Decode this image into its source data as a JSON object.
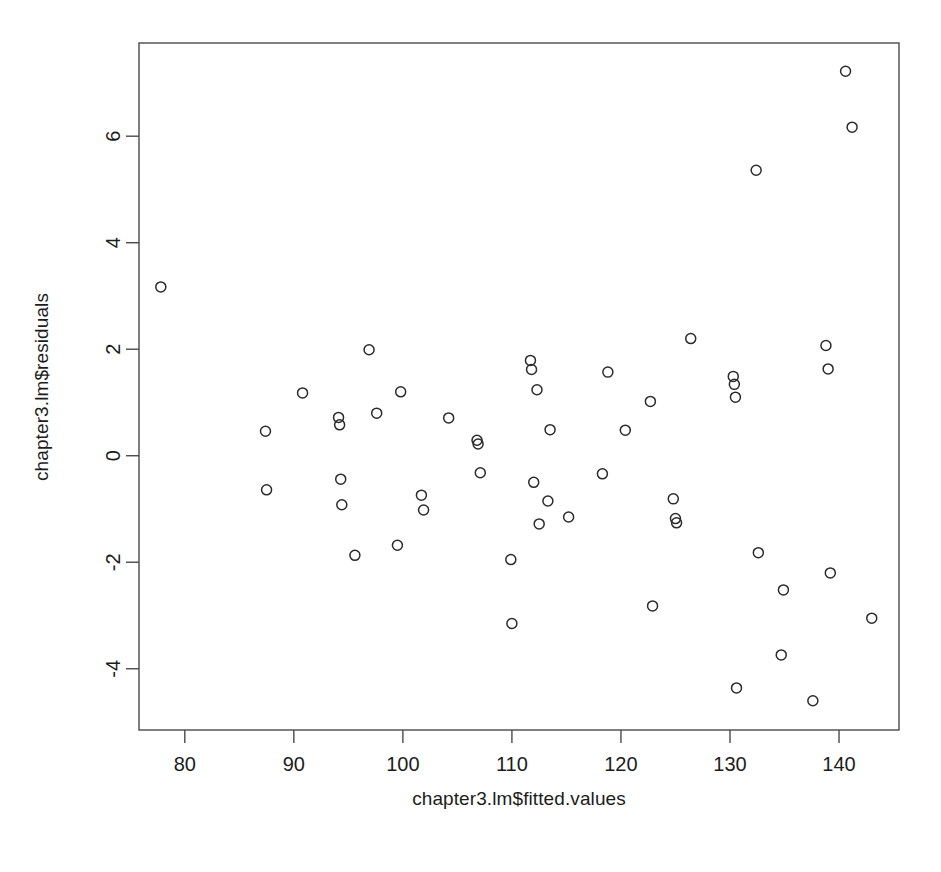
{
  "chart_data": {
    "type": "scatter",
    "title": "",
    "xlabel": "chapter3.lm$fitted.values",
    "ylabel": "chapter3.lm$residuals",
    "xlim": [
      75.8,
      145.5
    ],
    "ylim": [
      -5.15,
      7.75
    ],
    "xticks": [
      80,
      90,
      100,
      110,
      120,
      130,
      140
    ],
    "yticks": [
      -4,
      -2,
      0,
      2,
      4,
      6
    ],
    "xtick_labels": [
      "80",
      "90",
      "100",
      "110",
      "120",
      "130",
      "140"
    ],
    "ytick_labels": [
      "-4",
      "-2",
      "0",
      "2",
      "4",
      "6"
    ],
    "grid": false,
    "legend": false,
    "marker": "open-circle",
    "marker_color": "#2b2b2b",
    "point_count": 60,
    "points": [
      {
        "x": 77.8,
        "y": 3.17
      },
      {
        "x": 87.4,
        "y": 0.46
      },
      {
        "x": 87.5,
        "y": -0.64
      },
      {
        "x": 90.8,
        "y": 1.18
      },
      {
        "x": 94.1,
        "y": 0.72
      },
      {
        "x": 94.2,
        "y": 0.58
      },
      {
        "x": 94.3,
        "y": -0.44
      },
      {
        "x": 94.4,
        "y": -0.92
      },
      {
        "x": 95.6,
        "y": -1.87
      },
      {
        "x": 96.9,
        "y": 1.99
      },
      {
        "x": 97.6,
        "y": 0.8
      },
      {
        "x": 99.5,
        "y": -1.68
      },
      {
        "x": 99.8,
        "y": 1.2
      },
      {
        "x": 101.7,
        "y": -0.74
      },
      {
        "x": 101.9,
        "y": -1.02
      },
      {
        "x": 104.2,
        "y": 0.71
      },
      {
        "x": 106.8,
        "y": 0.29
      },
      {
        "x": 106.9,
        "y": 0.22
      },
      {
        "x": 107.1,
        "y": -0.32
      },
      {
        "x": 109.9,
        "y": -1.95
      },
      {
        "x": 110.0,
        "y": -3.15
      },
      {
        "x": 111.7,
        "y": 1.79
      },
      {
        "x": 111.8,
        "y": 1.62
      },
      {
        "x": 112.0,
        "y": -0.5
      },
      {
        "x": 112.3,
        "y": 1.24
      },
      {
        "x": 112.5,
        "y": -1.28
      },
      {
        "x": 113.3,
        "y": -0.85
      },
      {
        "x": 113.5,
        "y": 0.49
      },
      {
        "x": 115.2,
        "y": -1.15
      },
      {
        "x": 118.3,
        "y": -0.34
      },
      {
        "x": 118.8,
        "y": 1.57
      },
      {
        "x": 120.4,
        "y": 0.48
      },
      {
        "x": 122.7,
        "y": 1.02
      },
      {
        "x": 122.9,
        "y": -2.82
      },
      {
        "x": 124.8,
        "y": -0.81
      },
      {
        "x": 125.0,
        "y": -1.18
      },
      {
        "x": 125.1,
        "y": -1.26
      },
      {
        "x": 126.4,
        "y": 2.2
      },
      {
        "x": 130.3,
        "y": 1.49
      },
      {
        "x": 130.4,
        "y": 1.34
      },
      {
        "x": 130.5,
        "y": 1.1
      },
      {
        "x": 130.6,
        "y": -4.36
      },
      {
        "x": 132.4,
        "y": 5.36
      },
      {
        "x": 132.6,
        "y": -1.82
      },
      {
        "x": 134.7,
        "y": -3.74
      },
      {
        "x": 134.9,
        "y": -2.52
      },
      {
        "x": 137.6,
        "y": -4.6
      },
      {
        "x": 138.8,
        "y": 2.07
      },
      {
        "x": 139.0,
        "y": 1.63
      },
      {
        "x": 139.2,
        "y": -2.2
      },
      {
        "x": 140.6,
        "y": 7.22
      },
      {
        "x": 141.2,
        "y": 6.17
      },
      {
        "x": 143.0,
        "y": -3.05
      }
    ]
  },
  "axes": {
    "x_axis_label": "chapter3.lm$fitted.values",
    "y_axis_label": "chapter3.lm$residuals"
  },
  "colors": {
    "frame": "#4a4a4a",
    "point": "#2b2b2b",
    "text": "#1c1c1c",
    "background": "#ffffff"
  }
}
